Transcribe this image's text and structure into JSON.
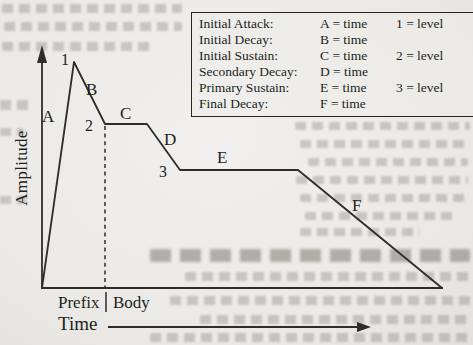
{
  "figure_type": "amplitude-envelope-diagram",
  "legend": {
    "rows": [
      {
        "name": "Initial Attack:",
        "time": "A = time",
        "level": "1 = level"
      },
      {
        "name": "Initial Decay:",
        "time": "B = time",
        "level": ""
      },
      {
        "name": "Initial Sustain:",
        "time": "C = time",
        "level": "2 = level"
      },
      {
        "name": "Secondary Decay:",
        "time": "D = time",
        "level": ""
      },
      {
        "name": "Primary Sustain:",
        "time": "E = time",
        "level": "3 = level"
      },
      {
        "name": "Final Decay:",
        "time": "F = time",
        "level": ""
      }
    ]
  },
  "axes": {
    "y_label": "Amplitude",
    "x_label": "Time"
  },
  "regions": {
    "prefix_label": "Prefix",
    "body_label": "Body"
  },
  "labels": {
    "attack": "A",
    "initial_decay": "B",
    "initial_sustain": "C",
    "secondary_decay": "D",
    "primary_sustain": "E",
    "final_decay": "F",
    "level1": "1",
    "level2": "2",
    "level3": "3"
  },
  "colors": {
    "line": "#2f2d29",
    "text": "#211f1c",
    "page_background": "#ecebe8"
  }
}
